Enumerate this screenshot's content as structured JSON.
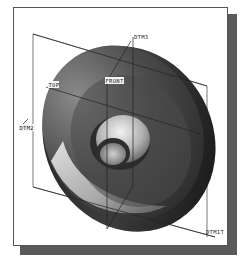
{
  "figure": {
    "colors": {
      "frame_border": "#555555",
      "shadow": "#5a5a5a",
      "model_dark": "#3a3a3a",
      "model_mid": "#6e6e6e",
      "model_light": "#d8d8d8",
      "datum_line": "#444444"
    }
  },
  "datum_labels": {
    "dtm3": "DTM3",
    "front": "FRONT",
    "top": "TOP",
    "dtm2": "DTM2",
    "dtm1": "DTM1T"
  }
}
